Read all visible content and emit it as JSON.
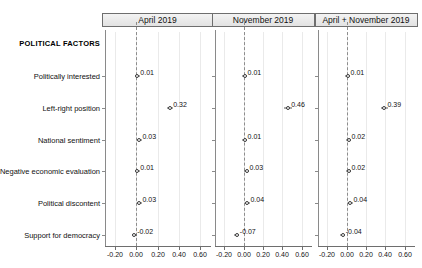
{
  "chart_data": {
    "type": "scatter",
    "title": "",
    "xlabel": "",
    "ylabel": "",
    "xlim": [
      -0.3,
      0.7
    ],
    "xticks": [
      -0.2,
      0.0,
      0.2,
      0.4,
      0.6
    ],
    "xtick_labels": [
      "-0.20",
      "0.00",
      "0.20",
      "0.40",
      "0.60"
    ],
    "grid": true,
    "zero_reference_line": 0.0,
    "legend_position": "none",
    "group_header": "POLITICAL FACTORS",
    "categories": [
      "Politically interested",
      "Left-right position",
      "National sentiment",
      "Negative economic evaluation",
      "Political discontent",
      "Support for democracy"
    ],
    "panels": [
      {
        "title": "April 2019",
        "values": [
          0.01,
          0.32,
          0.03,
          0.01,
          0.03,
          -0.02
        ],
        "labels": [
          "0.01",
          "0.32",
          "0.03",
          "0.01",
          "0.03",
          "-0.02"
        ]
      },
      {
        "title": "November 2019",
        "values": [
          0.01,
          0.46,
          0.01,
          0.03,
          0.04,
          -0.07
        ],
        "labels": [
          "0.01",
          "0.46",
          "0.01",
          "0.03",
          "0.04",
          "-0.07"
        ]
      },
      {
        "title": "April + November 2019",
        "values": [
          0.01,
          0.39,
          0.02,
          0.02,
          0.04,
          -0.04
        ],
        "labels": [
          "0.01",
          "0.39",
          "0.02",
          "0.02",
          "0.04",
          "-0.04"
        ]
      }
    ]
  },
  "colors": {
    "marker_edge": "#3b3b3b",
    "marker_fill": "#ffffff",
    "axis": "#6e6e6e",
    "grid": "#eaeaea",
    "zero_line": "#8d8d8d",
    "panel_header_bg": "#ebebeb",
    "text": "#111111"
  }
}
